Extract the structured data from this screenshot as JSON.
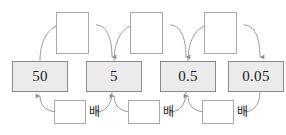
{
  "diagram": {
    "colors": {
      "value_box_fill": "#ebebeb",
      "value_box_border": "#8a8a8a",
      "blank_box_border": "#a8a8a8",
      "arc_stroke": "#9a9a9a",
      "text": "#1a1a1a"
    },
    "value_boxes": [
      {
        "label": "50"
      },
      {
        "label": "5"
      },
      {
        "label": "0.5"
      },
      {
        "label": "0.05"
      }
    ],
    "top_blank_boxes": [
      {
        "label": ""
      },
      {
        "label": ""
      },
      {
        "label": ""
      }
    ],
    "bottom_blank_boxes": [
      {
        "label": ""
      },
      {
        "label": ""
      },
      {
        "label": ""
      }
    ],
    "multiplier_labels": [
      {
        "label": "배"
      },
      {
        "label": "배"
      },
      {
        "label": "배"
      }
    ]
  }
}
